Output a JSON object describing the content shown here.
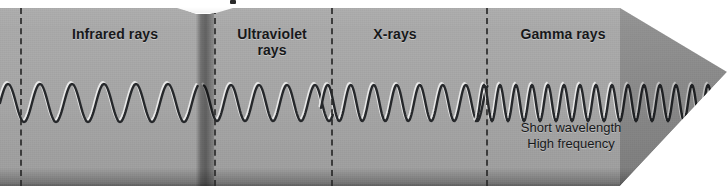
{
  "figure": {
    "kind": "electromagnetic-spectrum-arrow-banner",
    "direction": "left-to-right increasing frequency",
    "background_color": "#a7a7a7",
    "ink_color": "#17181a",
    "page_color": "#ffffff"
  },
  "sections": [
    {
      "id": "infrared",
      "label": "Infrared rays",
      "label_x": 115,
      "label_y": 26,
      "band_start": 0,
      "band_end": 196,
      "wavelength_px": 32,
      "amplitude_px": 19
    },
    {
      "id": "ultraviolet",
      "label": "Ultraviolet\nrays",
      "label_x": 272,
      "label_y": 26,
      "band_start": 214,
      "band_end": 331,
      "wavelength_px": 28,
      "amplitude_px": 18
    },
    {
      "id": "xrays",
      "label": "X-rays",
      "label_x": 395,
      "label_y": 26,
      "band_start": 331,
      "band_end": 486,
      "wavelength_px": 23,
      "amplitude_px": 18
    },
    {
      "id": "gamma",
      "label": "Gamma rays",
      "label_x": 563,
      "label_y": 26,
      "band_start": 486,
      "band_end": 727,
      "wavelength_px": 16,
      "amplitude_px": 18
    }
  ],
  "dividers": [
    20,
    214,
    331,
    486
  ],
  "visible_band": {
    "x": 196,
    "width": 18
  },
  "caption": {
    "line1": "Short wavelength",
    "line2": "High frequency"
  },
  "callout": {
    "shape": "white pointer wedge",
    "x": 150,
    "width": 110
  }
}
